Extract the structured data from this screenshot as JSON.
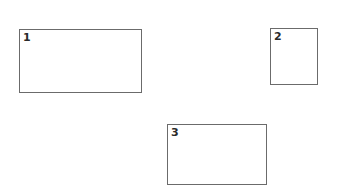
{
  "diagram": {
    "boxes": [
      {
        "label": "1",
        "x": 19,
        "y": 29,
        "w": 123,
        "h": 64
      },
      {
        "label": "2",
        "x": 270,
        "y": 28,
        "w": 48,
        "h": 57
      },
      {
        "label": "3",
        "x": 167,
        "y": 124,
        "w": 100,
        "h": 61
      }
    ]
  }
}
